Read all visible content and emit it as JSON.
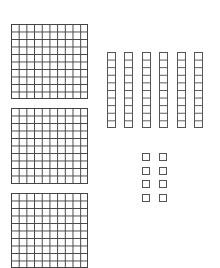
{
  "diagram": {
    "title": "Base-ten blocks",
    "line_color": "#444444",
    "background": "#ffffff",
    "hundreds": {
      "label": "hundreds flats",
      "count": 3,
      "grid": "10x10",
      "items": [
        {
          "x": 11,
          "y": 24,
          "w": 77,
          "h": 75
        },
        {
          "x": 11,
          "y": 108,
          "w": 77,
          "h": 76
        },
        {
          "x": 11,
          "y": 193,
          "w": 77,
          "h": 75
        }
      ]
    },
    "tens": {
      "label": "tens rods",
      "count": 6,
      "units_per_rod": 10,
      "items": [
        {
          "x": 107,
          "y": 52,
          "w": 9,
          "h": 76
        },
        {
          "x": 124,
          "y": 52,
          "w": 9,
          "h": 76
        },
        {
          "x": 142,
          "y": 52,
          "w": 9,
          "h": 76
        },
        {
          "x": 159,
          "y": 52,
          "w": 9,
          "h": 76
        },
        {
          "x": 177,
          "y": 52,
          "w": 9,
          "h": 76
        },
        {
          "x": 194,
          "y": 52,
          "w": 9,
          "h": 76
        }
      ]
    },
    "ones": {
      "label": "unit cubes",
      "count": 8,
      "items": [
        {
          "x": 142,
          "y": 153
        },
        {
          "x": 159,
          "y": 153
        },
        {
          "x": 142,
          "y": 167
        },
        {
          "x": 159,
          "y": 167
        },
        {
          "x": 142,
          "y": 180
        },
        {
          "x": 159,
          "y": 180
        },
        {
          "x": 142,
          "y": 194
        },
        {
          "x": 159,
          "y": 194
        }
      ]
    }
  }
}
